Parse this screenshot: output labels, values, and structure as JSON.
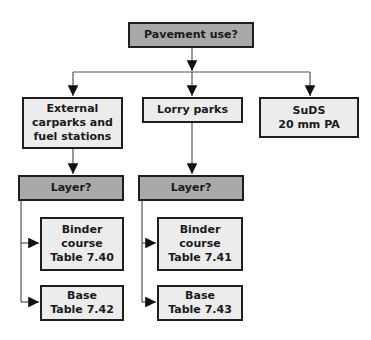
{
  "diagram": {
    "root": {
      "label": "Pavement use?"
    },
    "categories": [
      {
        "label": "External\ncarparks and\nfuel stations"
      },
      {
        "label": "Lorry parks"
      },
      {
        "label": "SuDS\n20 mm PA"
      }
    ],
    "layer_questions": [
      {
        "label": "Layer?"
      },
      {
        "label": "Layer?"
      }
    ],
    "external_layers": [
      {
        "label": "Binder\ncourse\nTable 7.40"
      },
      {
        "label": "Base\nTable 7.42"
      }
    ],
    "lorry_layers": [
      {
        "label": "Binder\ncourse\nTable 7.41"
      },
      {
        "label": "Base\nTable 7.43"
      }
    ],
    "colors": {
      "question_fill": "#a9a9a9",
      "option_fill": "#ececec",
      "border": "#1e1e1e",
      "line": "#555555"
    }
  }
}
